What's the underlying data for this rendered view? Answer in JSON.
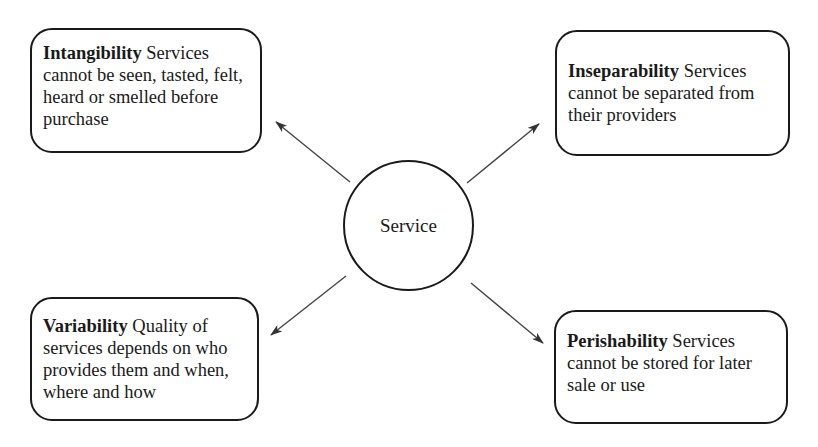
{
  "diagram": {
    "center": {
      "label": "Service"
    },
    "nodes": [
      {
        "id": "intangibility",
        "position": "top-left",
        "term": "Intangibility",
        "description": "Services cannot be seen, tasted, felt, heard or smelled before purchase"
      },
      {
        "id": "inseparability",
        "position": "top-right",
        "term": "Inseparability",
        "description": "Services cannot be separated from their providers"
      },
      {
        "id": "variability",
        "position": "bottom-left",
        "term": "Variability",
        "description": "Quality of services depends on who provides them and when, where and how"
      },
      {
        "id": "perishability",
        "position": "bottom-right",
        "term": "Perishability",
        "description": "Services cannot be stored for later sale or use"
      }
    ],
    "edges": [
      {
        "from": "Service",
        "to": "Intangibility"
      },
      {
        "from": "Service",
        "to": "Inseparability"
      },
      {
        "from": "Service",
        "to": "Variability"
      },
      {
        "from": "Service",
        "to": "Perishability"
      }
    ],
    "colors": {
      "stroke": "#1a1a1a",
      "arrow": "#333333",
      "background": "#ffffff"
    }
  }
}
